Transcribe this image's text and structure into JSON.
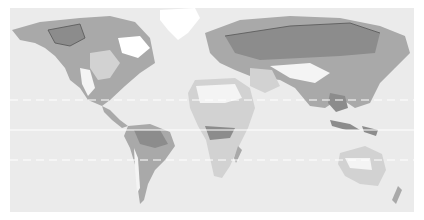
{
  "map": {
    "type": "world-biome-map",
    "projection": "equirectangular-like",
    "colors": {
      "ocean": "#ebebeb",
      "tundra": "#a9a9a9",
      "forest": "#8c8c8c",
      "grass": "#d2d2d2",
      "desert": "#f4f4f4",
      "ice": "#ffffff",
      "reference_line": "#ffffff"
    },
    "reference_lines": [
      {
        "name": "tropic-of-cancer",
        "style": "dashed"
      },
      {
        "name": "equator",
        "style": "solid"
      },
      {
        "name": "tropic-of-capricorn",
        "style": "dashed"
      }
    ]
  }
}
